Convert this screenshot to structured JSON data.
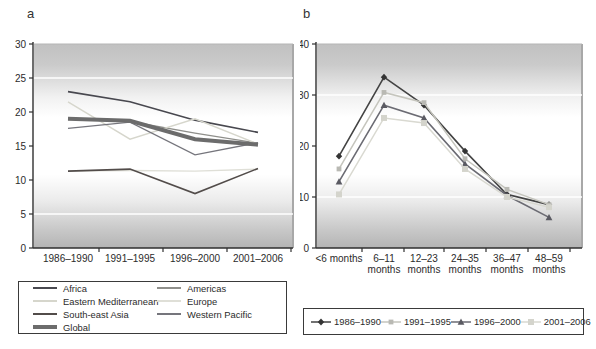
{
  "panels": {
    "a_label": "a",
    "b_label": "b"
  },
  "chart_data": [
    {
      "id": "a",
      "type": "line",
      "title": "",
      "xlabel": "",
      "ylabel": "",
      "categories": [
        "1986–1990",
        "1991–1995",
        "1996–2000",
        "2001–2006"
      ],
      "ylim": [
        0,
        30
      ],
      "yticks": [
        0,
        5,
        10,
        15,
        20,
        25,
        30
      ],
      "white_gridlines": [
        5,
        25
      ],
      "grid": false,
      "legend_position": "below-left-box",
      "series": [
        {
          "name": "Africa",
          "values": [
            23.0,
            21.5,
            18.8,
            17.0
          ],
          "color": "#48484f",
          "width": 1.6
        },
        {
          "name": "Americas",
          "values": [
            19.0,
            18.6,
            16.9,
            15.4
          ],
          "color": "#8f8f8b",
          "width": 1.3
        },
        {
          "name": "Eastern Mediterranean",
          "values": [
            21.5,
            16.0,
            19.0,
            15.3
          ],
          "color": "#d6d6cc",
          "width": 1.4
        },
        {
          "name": "Europe",
          "values": [
            11.3,
            11.4,
            11.3,
            11.6
          ],
          "color": "#dfdfd7",
          "width": 1.4
        },
        {
          "name": "South-east Asia",
          "values": [
            11.3,
            11.6,
            8.0,
            11.7
          ],
          "color": "#524c4a",
          "width": 1.6
        },
        {
          "name": "Western Pacific",
          "values": [
            17.6,
            18.5,
            13.7,
            15.5
          ],
          "color": "#75757c",
          "width": 1.3
        },
        {
          "name": "Global",
          "values": [
            19.0,
            18.7,
            16.0,
            15.2
          ],
          "color": "#6c6c6c",
          "width": 4.0
        }
      ]
    },
    {
      "id": "b",
      "type": "line",
      "title": "",
      "xlabel": "",
      "ylabel": "",
      "categories": [
        "<6 months",
        "6–11 months",
        "12–23 months",
        "24–35 months",
        "36–47 months",
        "48–59 months"
      ],
      "category_label_lines": [
        [
          "<6 months"
        ],
        [
          "6–11",
          "months"
        ],
        [
          "12–23",
          "months"
        ],
        [
          "24–35",
          "months"
        ],
        [
          "36–47",
          "months"
        ],
        [
          "48–59",
          "months"
        ]
      ],
      "ylim": [
        0,
        40
      ],
      "yticks": [
        0,
        10,
        20,
        30,
        40
      ],
      "white_gridlines": [
        10,
        30
      ],
      "grid": false,
      "legend_position": "below-box",
      "series": [
        {
          "name": "1986–1990",
          "values": [
            18.0,
            33.5,
            28.0,
            19.0,
            10.5,
            8.5
          ],
          "color": "#434343",
          "marker": "diamond",
          "marker_color": "#343434",
          "width": 1.6
        },
        {
          "name": "1991–1995",
          "values": [
            15.5,
            30.5,
            28.5,
            17.5,
            11.5,
            8.5
          ],
          "color": "#c5c5bd",
          "marker": "square",
          "marker_color": "#b9b9b3",
          "width": 1.5
        },
        {
          "name": "1996–2000",
          "values": [
            13.0,
            28.0,
            25.5,
            16.5,
            10.3,
            6.0
          ],
          "color": "#6b6b73",
          "marker": "triangle",
          "marker_color": "#5a5a62",
          "width": 1.6
        },
        {
          "name": "2001–2006",
          "values": [
            10.5,
            25.5,
            24.5,
            15.5,
            10.0,
            8.0
          ],
          "color": "#d9d9d1",
          "marker": "square-large",
          "marker_color": "#d4d4cc",
          "width": 1.5
        }
      ]
    }
  ],
  "colors": {
    "axis": "#2f2f2f",
    "plot_right_edge": "#a8a8a8",
    "plot_top_edge": "#b5b5b5",
    "white_gridline": "#ffffff"
  }
}
